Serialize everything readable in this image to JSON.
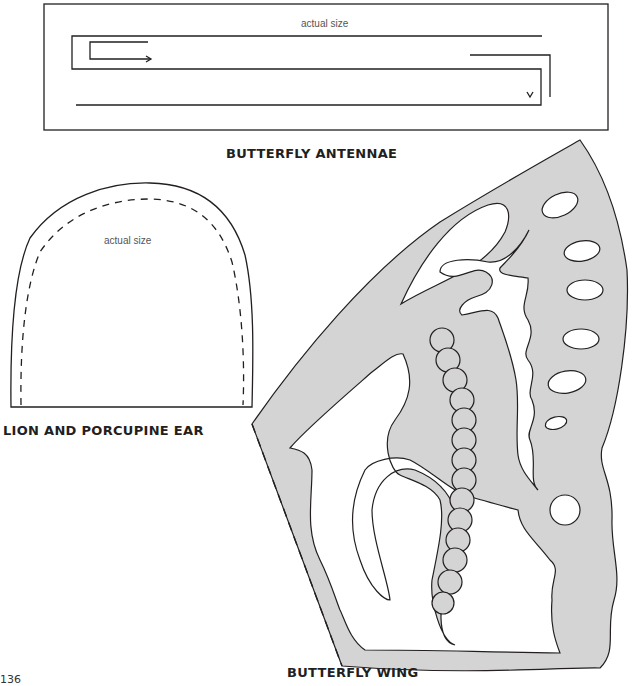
{
  "page": {
    "number": "136"
  },
  "templates": {
    "antennae": {
      "caption": "BUTTERFLY ANTENNAE",
      "note": "actual size"
    },
    "ear": {
      "caption": "LION AND PORCUPINE EAR",
      "note": "actual size"
    },
    "wing": {
      "caption": "BUTTERFLY WING",
      "fill_color": "#d4d4d4"
    }
  },
  "colors": {
    "line": "#231f20",
    "wing_fill": "#d4d4d4",
    "background": "#ffffff"
  }
}
